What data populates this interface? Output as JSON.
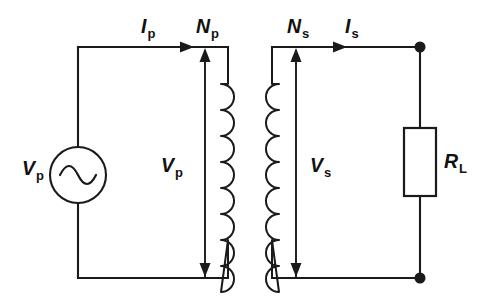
{
  "figure": {
    "kind": "transformer-circuit-schematic",
    "background_color": "#ffffff",
    "line_color": "#1a1a1a",
    "width": 482,
    "height": 298
  },
  "labels": {
    "primary_current": {
      "symbol": "I",
      "subscript": "p"
    },
    "primary_turns": {
      "symbol": "N",
      "subscript": "p"
    },
    "secondary_turns": {
      "symbol": "N",
      "subscript": "s"
    },
    "secondary_current": {
      "symbol": "I",
      "subscript": "s"
    },
    "primary_voltage": {
      "symbol": "V",
      "subscript": "p"
    },
    "secondary_voltage": {
      "symbol": "V",
      "subscript": "s"
    },
    "source_voltage": {
      "symbol": "V",
      "subscript": "p"
    },
    "load_resistor": {
      "symbol": "R",
      "subscript": "L"
    }
  },
  "components": {
    "ac_source": {
      "name": "ac-voltage-source",
      "glyph": "sine-wave"
    },
    "primary_coil": {
      "name": "primary-winding",
      "turns_drawn": 8,
      "bulge": "right"
    },
    "secondary_coil": {
      "name": "secondary-winding",
      "turns_drawn": 8,
      "bulge": "left"
    },
    "load": {
      "name": "load-resistor",
      "shape": "rectangle"
    },
    "nodes": [
      {
        "name": "top-right-node",
        "x": 420,
        "y": 47
      },
      {
        "name": "bottom-right-node",
        "x": 420,
        "y": 278
      }
    ]
  },
  "arrows": {
    "primary_current_direction": "right",
    "secondary_current_direction": "right",
    "primary_voltage_direction": "down",
    "secondary_voltage_direction": "down",
    "primary_turns_direction": "up",
    "secondary_turns_direction": "up"
  }
}
